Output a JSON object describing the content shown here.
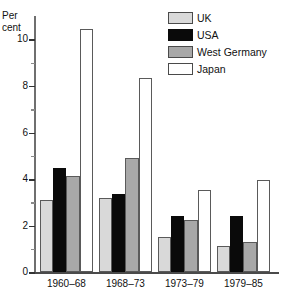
{
  "chart_data": {
    "type": "bar",
    "title": "",
    "xlabel": "",
    "ylabel": "Per cent",
    "ylabel_lines": [
      "Per",
      "cent"
    ],
    "ylim": [
      0,
      11
    ],
    "grid": false,
    "legend_position": "top-right",
    "categories": [
      "1960–68",
      "1968–73",
      "1973–79",
      "1979–85"
    ],
    "tick_labels": [
      "0",
      "2",
      "4",
      "6",
      "8",
      "10"
    ],
    "tick_values": [
      0,
      2,
      4,
      6,
      8,
      10
    ],
    "minor_tick_values": [
      1,
      3,
      5,
      7,
      9
    ],
    "series": [
      {
        "name": "UK",
        "color": "#d9d9d9",
        "values": [
          3.1,
          3.2,
          1.5,
          1.15
        ]
      },
      {
        "name": "USA",
        "color": "#0a0a0a",
        "values": [
          4.5,
          3.35,
          2.4,
          2.4
        ]
      },
      {
        "name": "West Germany",
        "color": "#a8a8a8",
        "values": [
          4.15,
          4.9,
          2.25,
          1.3
        ]
      },
      {
        "name": "Japan",
        "color": "#ffffff",
        "values": [
          10.45,
          8.35,
          3.55,
          3.95
        ]
      }
    ]
  },
  "legend": {
    "items": [
      {
        "label": "UK",
        "swatch": "uk"
      },
      {
        "label": "USA",
        "swatch": "usa"
      },
      {
        "label": "West Germany",
        "swatch": "wgermany"
      },
      {
        "label": "Japan",
        "swatch": "japan"
      }
    ]
  },
  "axis": {
    "y_title_line1": "Per",
    "y_title_line2": "cent"
  }
}
